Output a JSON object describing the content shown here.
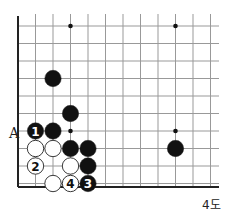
{
  "diagram": {
    "caption": "4도",
    "label_A": "A",
    "grid": {
      "x0": 18,
      "y0": 26,
      "step": 17.5,
      "cols": 12,
      "rows": 10,
      "right_edge": 219,
      "bottom_edge": 187
    },
    "star_points": [
      [
        3,
        0
      ],
      [
        9,
        0
      ],
      [
        3,
        6
      ],
      [
        9,
        6
      ]
    ],
    "stones": [
      {
        "color": "black",
        "col": 2,
        "row": 3,
        "label": ""
      },
      {
        "color": "black",
        "col": 3,
        "row": 5,
        "label": ""
      },
      {
        "color": "black",
        "col": 1,
        "row": 6,
        "label": "1"
      },
      {
        "color": "black",
        "col": 2,
        "row": 6,
        "label": ""
      },
      {
        "color": "white",
        "col": 1,
        "row": 7,
        "label": ""
      },
      {
        "color": "white",
        "col": 2,
        "row": 7,
        "label": ""
      },
      {
        "color": "black",
        "col": 3,
        "row": 7,
        "label": ""
      },
      {
        "color": "black",
        "col": 4,
        "row": 7,
        "label": ""
      },
      {
        "color": "white",
        "col": 1,
        "row": 8,
        "label": "2"
      },
      {
        "color": "white",
        "col": 3,
        "row": 8,
        "label": ""
      },
      {
        "color": "black",
        "col": 4,
        "row": 8,
        "label": ""
      },
      {
        "color": "white",
        "col": 2,
        "row": 9,
        "label": ""
      },
      {
        "color": "white",
        "col": 3,
        "row": 9,
        "label": "4"
      },
      {
        "color": "black",
        "col": 4,
        "row": 9,
        "label": "3"
      },
      {
        "color": "black",
        "col": 9,
        "row": 7,
        "label": ""
      }
    ],
    "colors": {
      "line": "#999999",
      "edge": "#222222",
      "black": "#111111",
      "white": "#ffffff"
    }
  }
}
